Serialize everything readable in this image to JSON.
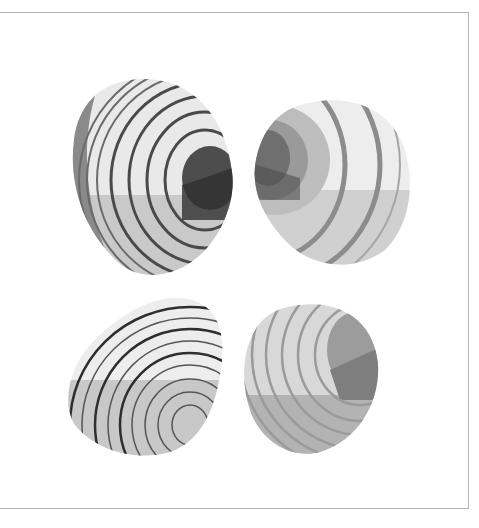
{
  "illustration": {
    "subject": "four clam shells",
    "palette": {
      "light": "#ececec",
      "mid_light": "#cfcfcf",
      "mid": "#a9a9a9",
      "dark": "#6f6f6f",
      "darkest": "#3a3a3a",
      "frame": "#b5b5b5",
      "background": "#ffffff"
    },
    "shells": [
      {
        "position": "top-left",
        "style": "dark rings with dark umbo"
      },
      {
        "position": "top-right",
        "style": "wide gray bands, umbo at left"
      },
      {
        "position": "bottom-left",
        "style": "thin black rings, light shell"
      },
      {
        "position": "bottom-right",
        "style": "gray rings, darker umbo at right"
      }
    ]
  }
}
